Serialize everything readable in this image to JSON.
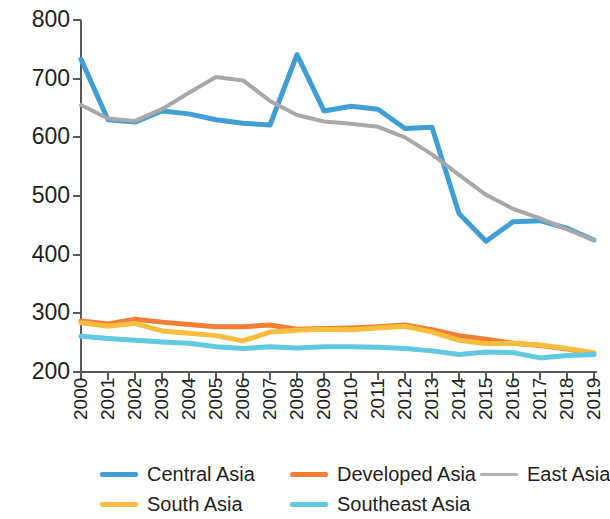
{
  "chart_data": {
    "type": "line",
    "title": "",
    "xlabel": "",
    "ylabel": "",
    "x": [
      "2000",
      "2001",
      "2002",
      "2003",
      "2004",
      "2005",
      "2006",
      "2007",
      "2008",
      "2009",
      "2010",
      "2011",
      "2012",
      "2013",
      "2014",
      "2015",
      "2016",
      "2017",
      "2018",
      "2019"
    ],
    "categories": [
      "2000",
      "2001",
      "2002",
      "2003",
      "2004",
      "2005",
      "2006",
      "2007",
      "2008",
      "2009",
      "2010",
      "2011",
      "2012",
      "2013",
      "2014",
      "2015",
      "2016",
      "2017",
      "2018",
      "2019"
    ],
    "ylim": [
      200,
      800
    ],
    "yticks": [
      200,
      300,
      400,
      500,
      600,
      700,
      800
    ],
    "ytick_labels": [
      "200",
      "300",
      "400",
      "500",
      "600",
      "700",
      "800"
    ],
    "grid": false,
    "legend_position": "bottom",
    "series": [
      {
        "name": "Central Asia",
        "color": "#3f9fd4",
        "style": "solid",
        "values": [
          733,
          630,
          626,
          645,
          640,
          630,
          624,
          621,
          741,
          645,
          653,
          648,
          615,
          617,
          470,
          423,
          456,
          458,
          445,
          425
        ]
      },
      {
        "name": "Developed Asia",
        "color": "#f07f35",
        "style": "solid",
        "values": [
          287,
          282,
          290,
          285,
          281,
          277,
          277,
          280,
          273,
          274,
          275,
          277,
          280,
          272,
          262,
          256,
          249,
          245,
          239,
          232
        ]
      },
      {
        "name": "East Asia",
        "color": "#a8a8a8",
        "style": "solid",
        "values": [
          655,
          632,
          628,
          648,
          676,
          703,
          697,
          662,
          638,
          627,
          623,
          618,
          600,
          571,
          536,
          502,
          478,
          462,
          443,
          425
        ]
      },
      {
        "name": "South Asia",
        "color": "#f7bd3f",
        "style": "solid",
        "values": [
          284,
          278,
          283,
          270,
          266,
          262,
          253,
          268,
          271,
          273,
          272,
          275,
          278,
          268,
          254,
          248,
          249,
          246,
          240,
          233
        ]
      },
      {
        "name": "Southeast Asia",
        "color": "#61c9e0",
        "style": "solid",
        "values": [
          261,
          257,
          254,
          251,
          249,
          243,
          240,
          243,
          241,
          243,
          243,
          242,
          240,
          236,
          230,
          234,
          233,
          224,
          228,
          230
        ]
      }
    ]
  },
  "legend": {
    "items": [
      {
        "label": "Central Asia",
        "color": "#3f9fd4",
        "thickness": 5
      },
      {
        "label": "Developed Asia",
        "color": "#f07f35",
        "thickness": 5
      },
      {
        "label": "East Asia",
        "color": "#b3b3b3",
        "thickness": 3
      },
      {
        "label": "South Asia",
        "color": "#f7bd3f",
        "thickness": 5
      },
      {
        "label": "Southeast Asia",
        "color": "#61c9e0",
        "thickness": 5
      }
    ]
  },
  "axis": {
    "line_color": "#58595b",
    "tick_color": "#58595b"
  }
}
